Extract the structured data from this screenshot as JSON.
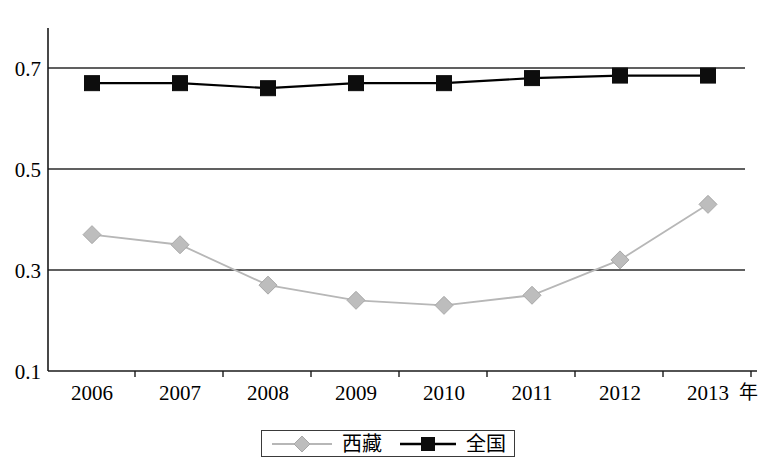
{
  "chart_data": {
    "type": "line",
    "title": "",
    "subtitle": "",
    "xlabel": "年",
    "ylabel": "",
    "categories": [
      "2006",
      "2007",
      "2008",
      "2009",
      "2010",
      "2011",
      "2012",
      "2013"
    ],
    "x": [
      2006,
      2007,
      2008,
      2009,
      2010,
      2011,
      2012,
      2013
    ],
    "series": [
      {
        "name": "西藏",
        "marker": "diamond",
        "color": "#bdbdbd",
        "line_color": "#b7b7b7",
        "values": [
          0.37,
          0.35,
          0.27,
          0.24,
          0.23,
          0.25,
          0.32,
          0.43
        ]
      },
      {
        "name": "全国",
        "marker": "square",
        "color": "#0d0d0d",
        "line_color": "#000000",
        "values": [
          0.67,
          0.67,
          0.66,
          0.67,
          0.67,
          0.68,
          0.685,
          0.685
        ]
      }
    ],
    "ylim": [
      0.1,
      0.7
    ],
    "yticks": [
      "0.1",
      "0.3",
      "0.5",
      "0.7"
    ],
    "ytick_values": [
      0.1,
      0.3,
      0.5,
      0.7
    ],
    "xlim": [
      2005.5,
      2013.5
    ],
    "grid": "horizontal",
    "legend_position": "bottom",
    "legend_entries": [
      "西藏",
      "全国"
    ]
  },
  "axes": {
    "y_tick_labels": [
      "0.7",
      "0.5",
      "0.3",
      "0.1"
    ],
    "x_tick_labels": [
      "2006",
      "2007",
      "2008",
      "2009",
      "2010",
      "2011",
      "2012",
      "2013"
    ],
    "x_unit_label": "年"
  },
  "legend": {
    "items": [
      {
        "label": "西藏",
        "marker": "diamond-marker",
        "color": "#bdbdbd"
      },
      {
        "label": "全国",
        "marker": "square-marker",
        "color": "#0d0d0d"
      }
    ]
  }
}
